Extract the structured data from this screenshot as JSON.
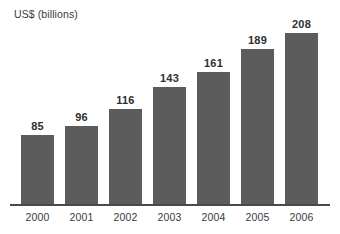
{
  "chart_data": {
    "type": "bar",
    "title": "",
    "ylabel": "US$ (billions)",
    "xlabel": "",
    "categories": [
      "2000",
      "2001",
      "2002",
      "2003",
      "2004",
      "2005",
      "2006"
    ],
    "values": [
      85,
      96,
      116,
      143,
      161,
      189,
      208
    ],
    "value_labels": [
      "85",
      "96",
      "116",
      "143",
      "161",
      "189",
      "208"
    ],
    "ylim": [
      0,
      208
    ],
    "grid": false,
    "legend": null,
    "bar_color": "#5c5c5c",
    "text_color": "#3a3a3a",
    "axis_color": "#4a4a4a",
    "background_color": "#ffffff"
  }
}
